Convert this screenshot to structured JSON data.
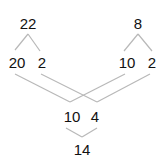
{
  "diagram": {
    "type": "number-decomposition",
    "colors": {
      "text": "#111111",
      "line": "#b8b8b8",
      "background": "#ffffff"
    },
    "nodes": {
      "top_left": {
        "label": "22",
        "x": 28,
        "y": 29
      },
      "top_right": {
        "label": "8",
        "x": 138,
        "y": 29
      },
      "mid_left_a": {
        "label": "20",
        "x": 17,
        "y": 68
      },
      "mid_left_b": {
        "label": "2",
        "x": 42,
        "y": 68
      },
      "mid_right_a": {
        "label": "10",
        "x": 127,
        "y": 68
      },
      "mid_right_b": {
        "label": "2",
        "x": 152,
        "y": 68
      },
      "bottom_a": {
        "label": "10",
        "x": 72,
        "y": 122
      },
      "bottom_b": {
        "label": "4",
        "x": 95,
        "y": 122
      },
      "result": {
        "label": "14",
        "x": 82,
        "y": 155
      }
    },
    "edges": [
      {
        "from": "top_left",
        "to": "mid_left_a",
        "x1": 28,
        "y1": 34,
        "x2": 15,
        "y2": 50
      },
      {
        "from": "top_left",
        "to": "mid_left_b",
        "x1": 28,
        "y1": 34,
        "x2": 40,
        "y2": 51
      },
      {
        "from": "top_right",
        "to": "mid_right_a",
        "x1": 138,
        "y1": 34,
        "x2": 124,
        "y2": 51
      },
      {
        "from": "top_right",
        "to": "mid_right_b",
        "x1": 138,
        "y1": 34,
        "x2": 152,
        "y2": 51
      },
      {
        "from": "mid_left_a",
        "to": "bottom_a",
        "x1": 15,
        "y1": 74,
        "x2": 70,
        "y2": 102
      },
      {
        "from": "mid_right_a",
        "to": "bottom_a",
        "x1": 125,
        "y1": 74,
        "x2": 70,
        "y2": 102
      },
      {
        "from": "mid_left_b",
        "to": "bottom_b",
        "x1": 41,
        "y1": 74,
        "x2": 97,
        "y2": 102
      },
      {
        "from": "mid_right_b",
        "to": "bottom_b",
        "x1": 150,
        "y1": 74,
        "x2": 97,
        "y2": 102
      },
      {
        "from": "bottom_a",
        "to": "result",
        "x1": 66,
        "y1": 128,
        "x2": 82,
        "y2": 137
      },
      {
        "from": "bottom_b",
        "to": "result",
        "x1": 97,
        "y1": 128,
        "x2": 82,
        "y2": 137
      }
    ]
  }
}
